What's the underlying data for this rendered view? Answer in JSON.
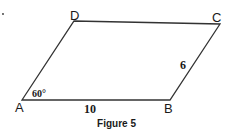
{
  "figure": {
    "caption": "Figure 5",
    "shape": "parallelogram",
    "vertices": {
      "A": {
        "label": "A"
      },
      "B": {
        "label": "B"
      },
      "C": {
        "label": "C"
      },
      "D": {
        "label": "D"
      }
    },
    "annotations": {
      "side_AB": "10",
      "side_BC": "6",
      "angle_A": "60°"
    },
    "colors": {
      "stroke": "#333333",
      "text": "#1a1a1a",
      "background": "#ffffff"
    }
  }
}
